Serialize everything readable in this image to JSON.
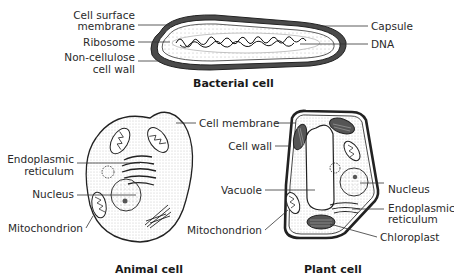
{
  "bacterial_cell": {
    "title": "Bacterial cell",
    "labels": {
      "cell_surface_membrane_1": "Cell surface",
      "cell_surface_membrane_2": "membrane",
      "ribosome": "Ribosome",
      "non_cellulose_1": "Non-cellulose",
      "non_cellulose_2": "cell wall",
      "capsule": "Capsule",
      "dna": "DNA"
    }
  },
  "animal_cell": {
    "title": "Animal cell",
    "labels": {
      "cell_membrane": "Cell membrane",
      "er_1": "Endoplasmic",
      "er_2": "reticulum",
      "nucleus": "Nucleus",
      "mitochondrion": "Mitochondrion"
    }
  },
  "plant_cell": {
    "title": "Plant cell",
    "labels": {
      "cell_wall": "Cell wall",
      "vacuole": "Vacuole",
      "mitochondrion": "Mitochondrion",
      "nucleus": "Nucleus",
      "er_1": "Endoplasmic",
      "er_2": "reticulum",
      "chloroplast": "Chloroplast"
    }
  }
}
